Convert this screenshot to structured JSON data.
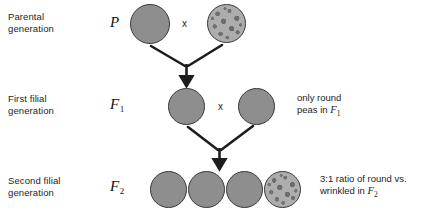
{
  "diagram": {
    "background_color": "#ffffff",
    "pea_round_color": "#8e8e8e",
    "pea_wrinkled_color": "#adadad",
    "stroke_color": "#1d1d1d"
  },
  "rows": [
    {
      "label": "Parental\ngeneration",
      "symbol": "P",
      "symbol_sub": "",
      "cross_mark": "x"
    },
    {
      "label": "First filial\ngeneration",
      "symbol": "F",
      "symbol_sub": "1",
      "cross_mark": "x"
    },
    {
      "label": "Second filial\ngeneration",
      "symbol": "F",
      "symbol_sub": "2",
      "cross_mark": ""
    }
  ],
  "peas": {
    "parental": [
      {
        "name": "round-pea",
        "type": "round"
      },
      {
        "name": "wrinkled-pea",
        "type": "wrinkled"
      }
    ],
    "f1": [
      {
        "name": "round-pea",
        "type": "round"
      },
      {
        "name": "round-pea",
        "type": "round"
      }
    ],
    "f2": [
      {
        "name": "round-pea",
        "type": "round"
      },
      {
        "name": "round-pea",
        "type": "round"
      },
      {
        "name": "round-pea",
        "type": "round"
      },
      {
        "name": "wrinkled-pea",
        "type": "wrinkled"
      }
    ]
  },
  "notes": {
    "f1_note_line1": "only round",
    "f1_note_line2_prefix": "peas in ",
    "f1_note_symbol": "F",
    "f1_note_subscript": "1",
    "f2_note_line1": "3:1 ratio of round vs.",
    "f2_note_line2_prefix": "wrinkled in ",
    "f2_note_symbol": "F",
    "f2_note_subscript": "2"
  }
}
